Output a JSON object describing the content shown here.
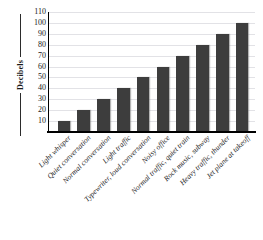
{
  "chart_data": {
    "type": "bar",
    "title": "",
    "xlabel": "",
    "ylabel": "Decibels",
    "ylim": [
      0,
      110
    ],
    "ytick_values": [
      10,
      20,
      30,
      40,
      50,
      60,
      70,
      80,
      90,
      100,
      110
    ],
    "grid": true,
    "legend": false,
    "bar_color": "#3d3d3d",
    "grid_color": "#e2e2e6",
    "axis_color": "#000000",
    "categories": [
      "Light whisper",
      "Quiet conversation",
      "Normal conversation",
      "Light traffic",
      "Typewriter, loud conversation",
      "Noisy office",
      "Normal traffic, quiet train",
      "Rock music, subway",
      "Heavy traffic, thunder",
      "Jet plane at takeoff"
    ],
    "values": [
      10,
      20,
      30,
      40,
      50,
      60,
      70,
      80,
      90,
      100
    ]
  }
}
